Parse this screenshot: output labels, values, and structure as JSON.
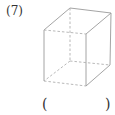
{
  "problem": {
    "number_label": "(7)",
    "answer_open": "(",
    "answer_close": ")"
  },
  "figure": {
    "type": "cube",
    "solid_color": "#9a9a9a",
    "hidden_color": "#b0b0b0"
  }
}
